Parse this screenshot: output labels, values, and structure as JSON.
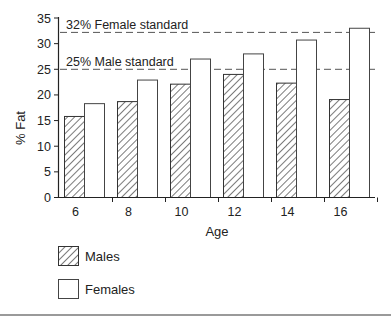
{
  "chart_data": {
    "type": "bar",
    "title": "",
    "xlabel": "Age",
    "ylabel": "% Fat",
    "categories": [
      "6",
      "8",
      "10",
      "12",
      "14",
      "16"
    ],
    "series": [
      {
        "name": "Males",
        "pattern": "diagonal-hatch",
        "values": [
          15.8,
          18.7,
          22.1,
          24.0,
          22.3,
          19.1
        ]
      },
      {
        "name": "Females",
        "pattern": "white",
        "values": [
          18.3,
          22.9,
          27.0,
          28.0,
          30.7,
          33.0
        ]
      }
    ],
    "ylim": [
      0,
      35
    ],
    "yticks": [
      0,
      5,
      10,
      15,
      20,
      25,
      30,
      35
    ],
    "grid": false,
    "reference_lines": [
      {
        "label": "32% Female standard",
        "y": 32,
        "style": "dashed"
      },
      {
        "label": "25% Male standard",
        "y": 25,
        "style": "dashed"
      }
    ],
    "legend": {
      "position": "bottom-left",
      "entries": [
        "Males",
        "Females"
      ]
    }
  },
  "axes": {
    "xlabel": "Age",
    "ylabel": "% Fat",
    "yticks": [
      "0",
      "5",
      "10",
      "15",
      "20",
      "25",
      "30",
      "35"
    ],
    "xticks": [
      "6",
      "8",
      "10",
      "12",
      "14",
      "16"
    ]
  },
  "annotations": {
    "female_standard": "32% Female standard",
    "male_standard": "25% Male standard"
  },
  "legend": {
    "males": "Males",
    "females": "Females"
  },
  "colors": {
    "stroke": "#222222",
    "dash": "#555555",
    "background": "#ffffff"
  }
}
